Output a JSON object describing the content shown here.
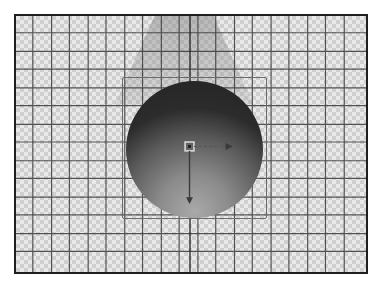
{
  "canvas": {
    "background": "transparency-checkerboard",
    "grid": {
      "spacing_px": 18.6,
      "line_color": "#3a3a3a",
      "frame_color": "#1e1e1e"
    },
    "checker_colors": [
      "#e9e9e9",
      "#cfcfcf"
    ]
  },
  "scene": {
    "object": {
      "type": "sphere",
      "shading": "gradient-dark-top-light-bottom",
      "colors": {
        "dark": "#232323",
        "mid": "#5a5a5a",
        "light": "#a9a9a9"
      }
    },
    "light_cone": {
      "direction": "from-top",
      "color": "#9a9a9a"
    },
    "selection_box": {
      "color": "#6a6a6a"
    },
    "gizmo": {
      "icons": [
        "pivot-handle-icon",
        "x-axis-arrow-icon",
        "y-axis-arrow-icon"
      ]
    }
  }
}
